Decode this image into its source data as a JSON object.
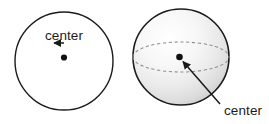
{
  "figure": {
    "background_color": "#ffffff",
    "stroke_color": "#1b1b1b",
    "dashed_stroke_color": "#8a8a8a",
    "dot_color": "#111111",
    "text_color": "#1b1b1b",
    "sphere_highlight_color": "#ffffff",
    "sphere_shade_color": "#cfcfcf"
  },
  "circle_figure": {
    "shape_name": "circle",
    "label": "center",
    "center_x": 64,
    "center_y": 61,
    "radius": 49,
    "dot_x": 64,
    "dot_y": 56,
    "label_x": 64,
    "label_y": 40,
    "arrow_from_y": 43,
    "arrow_to_y": 52
  },
  "sphere_figure": {
    "shape_name": "sphere",
    "label": "center",
    "center_x": 181,
    "center_y": 57,
    "radius": 48,
    "dot_x": 179,
    "dot_y": 57,
    "label_x": 224,
    "label_y": 115,
    "equator_rx": 48,
    "equator_ry": 15,
    "arrow_from_x": 219,
    "arrow_from_y": 103,
    "arrow_to_x": 182,
    "arrow_to_y": 61
  }
}
